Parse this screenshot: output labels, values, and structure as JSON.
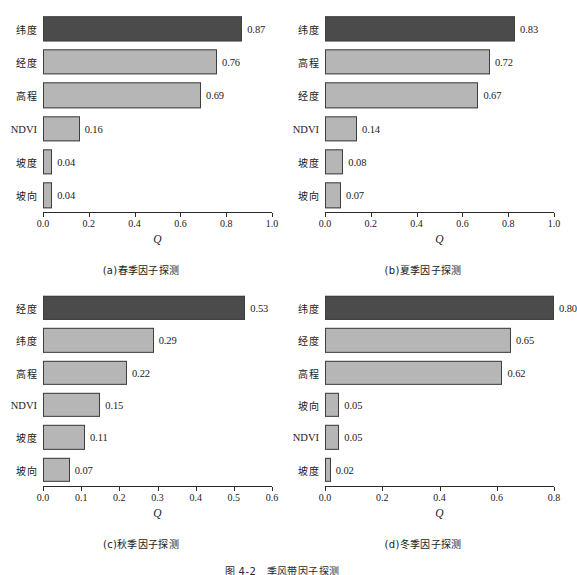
{
  "figure": {
    "caption": "图 4-2　季风带因子探测",
    "axis_title": "Q",
    "colors": {
      "bar_top": "#4b4b4b",
      "bar_other": "#b6b6b6",
      "bar_edge": "#3f3f3f",
      "axis": "#2b2b2b",
      "background": "#ffffff"
    }
  },
  "chart_data": [
    {
      "id": "panel-a",
      "type": "bar",
      "orientation": "horizontal",
      "title": "(a)春季因子探测",
      "xlabel": "Q",
      "ylabel": "",
      "xlim": [
        0.0,
        1.0
      ],
      "xticks": [
        "0.0",
        "0.2",
        "0.4",
        "0.6",
        "0.8",
        "1.0"
      ],
      "xtick_values": [
        0.0,
        0.2,
        0.4,
        0.6,
        0.8,
        1.0
      ],
      "grid": false,
      "legend": "none",
      "categories": [
        "纬度",
        "经度",
        "高程",
        "NDVI",
        "坡度",
        "坡向"
      ],
      "values": [
        0.87,
        0.76,
        0.69,
        0.16,
        0.04,
        0.04
      ],
      "labels": [
        "0.87",
        "0.76",
        "0.69",
        "0.16",
        "0.04",
        "0.04"
      ],
      "highlight_index": 0
    },
    {
      "id": "panel-b",
      "type": "bar",
      "orientation": "horizontal",
      "title": "(b)夏季因子探测",
      "xlabel": "Q",
      "ylabel": "",
      "xlim": [
        0.0,
        1.0
      ],
      "xticks": [
        "0.0",
        "0.2",
        "0.4",
        "0.6",
        "0.8",
        "1.0"
      ],
      "xtick_values": [
        0.0,
        0.2,
        0.4,
        0.6,
        0.8,
        1.0
      ],
      "grid": false,
      "legend": "none",
      "categories": [
        "纬度",
        "高程",
        "经度",
        "NDVI",
        "坡度",
        "坡向"
      ],
      "values": [
        0.83,
        0.72,
        0.67,
        0.14,
        0.08,
        0.07
      ],
      "labels": [
        "0.83",
        "0.72",
        "0.67",
        "0.14",
        "0.08",
        "0.07"
      ],
      "highlight_index": 0
    },
    {
      "id": "panel-c",
      "type": "bar",
      "orientation": "horizontal",
      "title": "(c)秋季因子探测",
      "xlabel": "Q",
      "ylabel": "",
      "xlim": [
        0.0,
        0.6
      ],
      "xticks": [
        "0.0",
        "0.1",
        "0.2",
        "0.3",
        "0.4",
        "0.5",
        "0.6"
      ],
      "xtick_values": [
        0.0,
        0.1,
        0.2,
        0.3,
        0.4,
        0.5,
        0.6
      ],
      "grid": false,
      "legend": "none",
      "categories": [
        "经度",
        "纬度",
        "高程",
        "NDVI",
        "坡度",
        "坡向"
      ],
      "values": [
        0.53,
        0.29,
        0.22,
        0.15,
        0.11,
        0.07
      ],
      "labels": [
        "0.53",
        "0.29",
        "0.22",
        "0.15",
        "0.11",
        "0.07"
      ],
      "highlight_index": 0
    },
    {
      "id": "panel-d",
      "type": "bar",
      "orientation": "horizontal",
      "title": "(d)冬季因子探测",
      "xlabel": "Q",
      "ylabel": "",
      "xlim": [
        0.0,
        0.8
      ],
      "xticks": [
        "0.0",
        "0.2",
        "0.4",
        "0.6",
        "0.8"
      ],
      "xtick_values": [
        0.0,
        0.2,
        0.4,
        0.6,
        0.8
      ],
      "grid": false,
      "legend": "none",
      "categories": [
        "纬度",
        "经度",
        "高程",
        "坡向",
        "NDVI",
        "坡度"
      ],
      "values": [
        0.8,
        0.65,
        0.62,
        0.05,
        0.05,
        0.02
      ],
      "labels": [
        "0.80",
        "0.65",
        "0.62",
        "0.05",
        "0.05",
        "0.02"
      ],
      "highlight_index": 0
    }
  ]
}
